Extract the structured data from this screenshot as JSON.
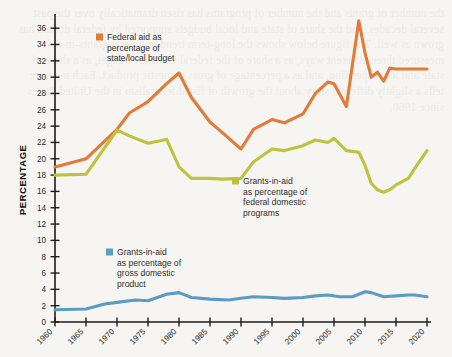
{
  "chart_data": {
    "type": "line",
    "title": "",
    "xlabel": "",
    "ylabel": "PERCENTAGE",
    "xlim": [
      1960,
      2020
    ],
    "ylim": [
      0,
      37
    ],
    "yticks": [
      0,
      2,
      4,
      6,
      8,
      10,
      12,
      14,
      16,
      18,
      20,
      22,
      24,
      26,
      28,
      30,
      32,
      34,
      36
    ],
    "xticks": [
      1960,
      1965,
      1970,
      1975,
      1980,
      1985,
      1990,
      1995,
      2000,
      2005,
      2010,
      2015,
      2020
    ],
    "xtick_labels": [
      "1960",
      "1965",
      "1970",
      "1975",
      "1980",
      "1985",
      "1990",
      "1995",
      "2000",
      "2005",
      "2010",
      "2015",
      "2020"
    ],
    "grid": false,
    "legend_position": "inline-annotations",
    "series": [
      {
        "name": "Federal aid as percentage of state/local budget",
        "color": "#E07B39",
        "x": [
          1960,
          1965,
          1970,
          1972,
          1975,
          1978,
          1980,
          1982,
          1985,
          1987,
          1990,
          1992,
          1995,
          1997,
          2000,
          2002,
          2004,
          2005,
          2007,
          2009,
          2010,
          2011,
          2012,
          2013,
          2014,
          2015,
          2017,
          2020
        ],
        "values": [
          19.0,
          20.0,
          23.6,
          25.6,
          27.0,
          29.2,
          30.5,
          27.5,
          24.5,
          23.2,
          21.2,
          23.6,
          24.8,
          24.4,
          25.5,
          28.0,
          29.4,
          29.2,
          26.4,
          36.9,
          33.0,
          30.0,
          30.6,
          29.5,
          31.1,
          31.0,
          31.0,
          31.0
        ]
      },
      {
        "name": "Grants-in-aid as percentage of federal domestic programs",
        "color": "#BFC23E",
        "x": [
          1960,
          1965,
          1970,
          1972,
          1975,
          1977,
          1978,
          1980,
          1982,
          1985,
          1987,
          1990,
          1992,
          1995,
          1997,
          2000,
          2002,
          2004,
          2005,
          2007,
          2009,
          2010,
          2011,
          2012,
          2013,
          2014,
          2015,
          2017,
          2018,
          2020
        ],
        "values": [
          18.0,
          18.1,
          23.5,
          22.8,
          21.9,
          22.2,
          22.4,
          19.0,
          17.6,
          17.6,
          17.5,
          17.6,
          19.6,
          21.2,
          21.0,
          21.6,
          22.3,
          22.0,
          22.5,
          21.0,
          20.8,
          19.2,
          17.0,
          16.2,
          15.9,
          16.2,
          16.8,
          17.6,
          18.8,
          21.0
        ]
      },
      {
        "name": "Grants-in-aid as percentage of gross domestic product",
        "color": "#5B9BC4",
        "x": [
          1960,
          1965,
          1968,
          1970,
          1973,
          1975,
          1978,
          1980,
          1982,
          1985,
          1988,
          1990,
          1992,
          1995,
          1997,
          2000,
          2002,
          2004,
          2006,
          2008,
          2010,
          2011,
          2013,
          2015,
          2017,
          2018,
          2020
        ],
        "values": [
          1.5,
          1.6,
          2.2,
          2.4,
          2.7,
          2.6,
          3.4,
          3.6,
          3.0,
          2.8,
          2.7,
          2.9,
          3.1,
          3.0,
          2.9,
          3.0,
          3.2,
          3.3,
          3.1,
          3.1,
          3.7,
          3.6,
          3.1,
          3.2,
          3.3,
          3.3,
          3.1
        ]
      }
    ]
  },
  "legends": [
    {
      "id": "federal-aid",
      "color": "#E07B39",
      "lines": [
        "Federal aid as",
        "percentage of",
        "state/local budget"
      ]
    },
    {
      "id": "federal-domestic",
      "color": "#BFC23E",
      "lines": [
        "Grants-in-aid",
        "as percentage of",
        "federal domestic",
        "programs"
      ]
    },
    {
      "id": "gdp",
      "color": "#5B9BC4",
      "lines": [
        "Grants-in-aid",
        "as percentage of",
        "gross domestic",
        "product"
      ]
    }
  ],
  "axis": {
    "y_title": "PERCENTAGE"
  },
  "background": {
    "bleed_text": "the number of grants and the number of programs has risen dramatically over the past several decades, and the share of state and local budgets supported by federal dollars has grown as well. The figure below shows the long-term trend in federal grants-in-aid measured three different ways, as a share of the federal domestic budget, as a share of state and local spending, and as a percentage of gross domestic product. Each measure tells a slightly different story about the growth of fiscal federalism in the United States since 1960."
  }
}
